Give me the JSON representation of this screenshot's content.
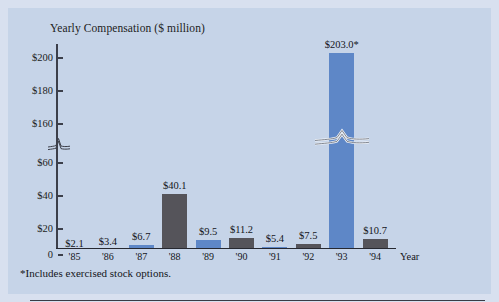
{
  "chart_data": {
    "type": "bar",
    "title": "Yearly Compensation ($ million)",
    "xlabel": "Year",
    "ylabel": "",
    "categories": [
      "'85",
      "'86",
      "'87",
      "'88",
      "'89",
      "'90",
      "'91",
      "'92",
      "'93",
      "'94"
    ],
    "values": [
      2.1,
      3.4,
      6.7,
      40.1,
      9.5,
      11.2,
      5.4,
      7.5,
      203.0,
      10.7
    ],
    "data_labels": [
      "$2.1",
      "$3.4",
      "$6.7",
      "$40.1",
      "$9.5",
      "$11.2",
      "$5.4",
      "$7.5",
      "$203.0*",
      "$10.7"
    ],
    "bar_colors": [
      "#5e87c7",
      "#55545a",
      "#5e87c7",
      "#55545a",
      "#5e87c7",
      "#55545a",
      "#5e87c7",
      "#55545a",
      "#5e87c7",
      "#55545a"
    ],
    "ytick_labels": [
      "$200",
      "$180",
      "$160",
      "$60",
      "$40",
      "$20",
      "0"
    ],
    "ytick_values": [
      200,
      180,
      160,
      60,
      40,
      20,
      0
    ],
    "ylim": [
      0,
      210
    ],
    "axis_break": true,
    "axis_break_between": [
      60,
      160
    ],
    "grid": false,
    "legend": "none",
    "annotations": [
      "*Includes exercised stock options."
    ]
  },
  "figure": {
    "title": "Yearly Compensation ($ million)",
    "axis_name_x": "Year",
    "footnote": "*Includes exercised stock options.",
    "colors": {
      "background": "#c6d4e8",
      "page": "#d8e0ef",
      "bar_blue": "#5e87c7",
      "bar_gray": "#55545a",
      "axis": "#3c3f4a",
      "text": "#14141a"
    }
  },
  "yticks": [
    {
      "label": "$200",
      "value": 200
    },
    {
      "label": "$180",
      "value": 180
    },
    {
      "label": "$160",
      "value": 160
    },
    {
      "label": "$60",
      "value": 60
    },
    {
      "label": "$40",
      "value": 40
    },
    {
      "label": "$20",
      "value": 20
    },
    {
      "label": "0",
      "value": 0
    }
  ],
  "bars": [
    {
      "year": "'85",
      "label": "$2.1",
      "value": 2.1,
      "color": "blue"
    },
    {
      "year": "'86",
      "label": "$3.4",
      "value": 3.4,
      "color": "gray"
    },
    {
      "year": "'87",
      "label": "$6.7",
      "value": 6.7,
      "color": "blue"
    },
    {
      "year": "'88",
      "label": "$40.1",
      "value": 40.1,
      "color": "gray"
    },
    {
      "year": "'89",
      "label": "$9.5",
      "value": 9.5,
      "color": "blue"
    },
    {
      "year": "'90",
      "label": "$11.2",
      "value": 11.2,
      "color": "gray"
    },
    {
      "year": "'91",
      "label": "$5.4",
      "value": 5.4,
      "color": "blue"
    },
    {
      "year": "'92",
      "label": "$7.5",
      "value": 7.5,
      "color": "gray"
    },
    {
      "year": "'93",
      "label": "$203.0*",
      "value": 203.0,
      "color": "blue"
    },
    {
      "year": "'94",
      "label": "$10.7",
      "value": 10.7,
      "color": "gray"
    }
  ]
}
